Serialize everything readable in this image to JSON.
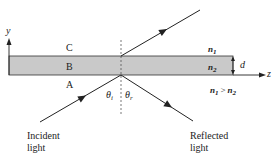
{
  "diagram": {
    "type": "thin-film-reflection",
    "axes": {
      "y_label": "y",
      "z_label": "z"
    },
    "regions": {
      "top": "C",
      "middle": "B",
      "bottom": "A"
    },
    "indices": {
      "n1_symbol": "n",
      "n1_sub": "1",
      "n2_symbol": "n",
      "n2_sub": "2",
      "relation_left": "n",
      "relation_left_sub": "1",
      "relation_op": ">",
      "relation_right": "n",
      "relation_right_sub": "2"
    },
    "thickness_label": "d",
    "angles": {
      "incident_symbol": "θ",
      "incident_sub": "i",
      "reflected_symbol": "θ",
      "reflected_sub": "r"
    },
    "ray_labels": {
      "incident_line1": "Incident",
      "incident_line2": "light",
      "reflected_line1": "Reflected",
      "reflected_line2": "light"
    },
    "colors": {
      "slab_fill": "#c9c9c9",
      "line": "#222222",
      "background": "#ffffff"
    }
  }
}
